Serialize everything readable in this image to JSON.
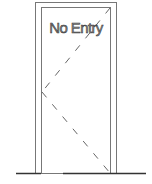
{
  "door": {
    "label": "No Entry",
    "label_color": "#888888",
    "line_color": "#555555",
    "floor_color": "#333333"
  }
}
